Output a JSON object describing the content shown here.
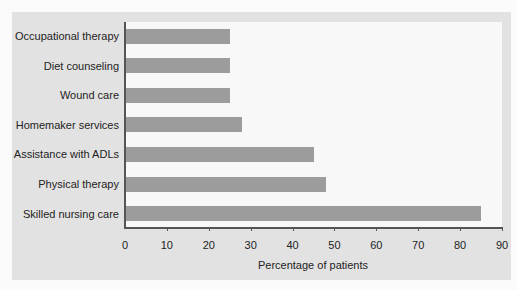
{
  "chart_data": {
    "type": "bar",
    "orientation": "horizontal",
    "title": "",
    "categories": [
      "Occupational therapy",
      "Diet counseling",
      "Wound care",
      "Homemaker services",
      "Assistance with ADLs",
      "Physical therapy",
      "Skilled nursing care"
    ],
    "values": [
      25,
      25,
      25,
      28,
      45,
      48,
      85
    ],
    "xlabel": "Percentage of patients",
    "ylabel": "",
    "xlim": [
      0,
      90
    ],
    "xticks": [
      "0",
      "10",
      "20",
      "30",
      "40",
      "50",
      "60",
      "70",
      "80",
      "90"
    ],
    "grid": false,
    "legend": null,
    "colors": {
      "bar": "#9c9c9c",
      "plot_bg": "#f8f8f8",
      "panel_bg": "#e2e2e2"
    }
  }
}
